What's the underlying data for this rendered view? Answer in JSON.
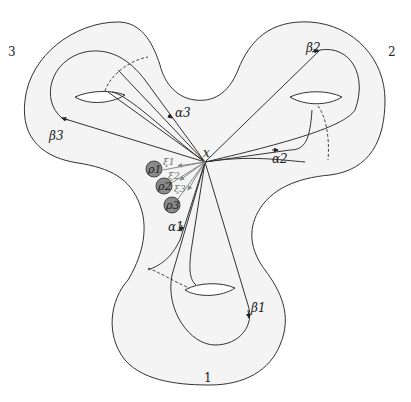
{
  "diagram": {
    "type": "genus-3 surface with loops",
    "colors": {
      "surface_fill": "#f4f4f4",
      "outline": "#333333",
      "grey_arrows": "#888888",
      "puncture_fill": "#8a8a8a",
      "dashed": "#444444"
    },
    "basepoint": {
      "label": "x"
    },
    "ends": [
      {
        "id": "1",
        "label": "1"
      },
      {
        "id": "2",
        "label": "2"
      },
      {
        "id": "3",
        "label": "3"
      }
    ],
    "loops": {
      "alpha": [
        "α1",
        "α2",
        "α3"
      ],
      "beta": [
        "β1",
        "β2",
        "β3"
      ],
      "xi": [
        "ξ1",
        "ξ2",
        "ξ3"
      ]
    },
    "punctures": [
      "ρ1",
      "ρ2",
      "ρ3"
    ]
  }
}
